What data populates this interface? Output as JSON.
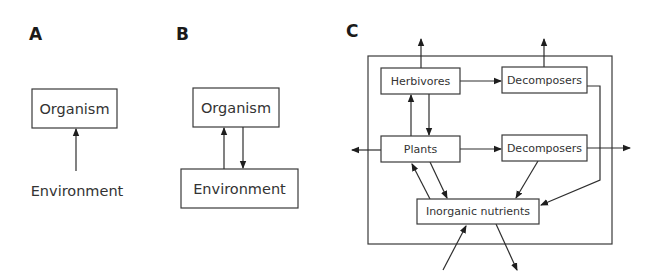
{
  "panels": {
    "a": {
      "label": "A",
      "organism": "Organism",
      "environment": "Environment"
    },
    "b": {
      "label": "B",
      "organism": "Organism",
      "environment": "Environment"
    },
    "c": {
      "label": "C",
      "herbivores": "Herbivores",
      "decomposers_top": "Decomposers",
      "plants": "Plants",
      "decomposers_mid": "Decomposers",
      "inorganic_nutrients": "Inorganic nutrients"
    }
  },
  "edges": [
    {
      "panel": "A",
      "from": "Environment",
      "to": "Organism"
    },
    {
      "panel": "B",
      "from": "Environment",
      "to": "Organism"
    },
    {
      "panel": "B",
      "from": "Organism",
      "to": "Environment"
    },
    {
      "panel": "C",
      "from": "Herbivores",
      "to": "outside (up)"
    },
    {
      "panel": "C",
      "from": "Decomposers (top)",
      "to": "outside (up)"
    },
    {
      "panel": "C",
      "from": "Herbivores",
      "to": "Decomposers (top)"
    },
    {
      "panel": "C",
      "from": "Plants",
      "to": "Herbivores"
    },
    {
      "panel": "C",
      "from": "Herbivores",
      "to": "Plants"
    },
    {
      "panel": "C",
      "from": "Plants",
      "to": "outside (left)"
    },
    {
      "panel": "C",
      "from": "Plants",
      "to": "Decomposers (middle)"
    },
    {
      "panel": "C",
      "from": "Decomposers (middle)",
      "to": "outside (right)"
    },
    {
      "panel": "C",
      "from": "Plants",
      "to": "Inorganic nutrients"
    },
    {
      "panel": "C",
      "from": "Inorganic nutrients",
      "to": "Plants"
    },
    {
      "panel": "C",
      "from": "Decomposers (middle)",
      "to": "Inorganic nutrients"
    },
    {
      "panel": "C",
      "from": "Decomposers (top)",
      "to": "Inorganic nutrients"
    },
    {
      "panel": "C",
      "from": "outside (below)",
      "to": "Inorganic nutrients"
    },
    {
      "panel": "C",
      "from": "Inorganic nutrients",
      "to": "outside (below)"
    }
  ]
}
